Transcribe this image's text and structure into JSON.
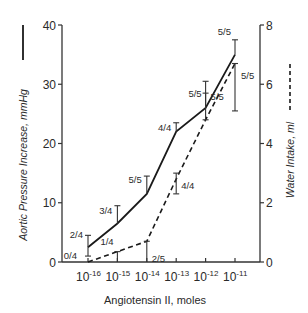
{
  "chart_data": {
    "type": "line",
    "title": "",
    "xlabel": "Angiotensin II, moles",
    "ylabel_left": "Aortic Pressure Increase, mmHg",
    "ylabel_right": "Water Intake, ml",
    "categories": [
      "10-16",
      "10-15",
      "10-14",
      "10-13",
      "10-12",
      "10-11"
    ],
    "x_tick_labels": [
      {
        "base": "10",
        "exp": "-16"
      },
      {
        "base": "10",
        "exp": "-15"
      },
      {
        "base": "10",
        "exp": "-14"
      },
      {
        "base": "10",
        "exp": "-13"
      },
      {
        "base": "10",
        "exp": "-12"
      },
      {
        "base": "10",
        "exp": "-11"
      }
    ],
    "left_axis": {
      "ylim": [
        0,
        40
      ],
      "ticks": [
        "0",
        "10",
        "20",
        "30",
        "40"
      ],
      "tick_values": [
        0,
        10,
        20,
        30,
        40
      ]
    },
    "right_axis": {
      "ylim": [
        0,
        8
      ],
      "ticks": [
        "0",
        "2",
        "4",
        "6",
        "8"
      ],
      "tick_values": [
        0,
        2,
        4,
        6,
        8
      ]
    },
    "series": [
      {
        "name": "Aortic Pressure Increase",
        "axis": "left",
        "style": "solid",
        "values": [
          2.5,
          6.5,
          11.5,
          22,
          26,
          35
        ],
        "error_low": [
          1,
          6.5,
          11.5,
          22,
          26,
          35
        ],
        "error_high": [
          4.5,
          9.5,
          14.5,
          23.5,
          28.5,
          37.5
        ],
        "annotations": [
          "2/4",
          "3/4",
          "5/5",
          "4/4",
          "5/5",
          "5/5"
        ]
      },
      {
        "name": "Water Intake",
        "axis": "right",
        "style": "dashed",
        "values": [
          0,
          0.35,
          0.7,
          2.8,
          4.8,
          6.7
        ],
        "error_low": [
          0,
          0,
          0,
          2.3,
          4.8,
          5.1
        ],
        "error_high": [
          0,
          0.35,
          0.7,
          3.0,
          6.1,
          6.7
        ],
        "annotations": [
          "0/4",
          "1/4",
          "2/5",
          "4/4",
          "5/5",
          "5/5"
        ]
      }
    ],
    "grid": false,
    "legend": "axis-labels"
  }
}
